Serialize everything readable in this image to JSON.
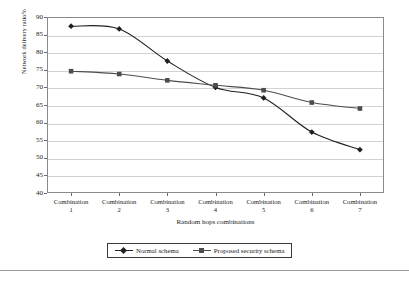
{
  "chart_data": {
    "type": "line",
    "title": "",
    "xlabel": "Random hops combinations",
    "ylabel": "Network delivery ratio%",
    "categories": [
      "Combination 1",
      "Combination 2",
      "Combination 3",
      "Combination 4",
      "Combination 5",
      "Combination 6",
      "Combination 7"
    ],
    "category_lines": [
      [
        "Combination",
        "1"
      ],
      [
        "Combination",
        "2"
      ],
      [
        "Combination",
        "3"
      ],
      [
        "Combination",
        "4"
      ],
      [
        "Combination",
        "5"
      ],
      [
        "Combination",
        "6"
      ],
      [
        "Combination",
        "7"
      ]
    ],
    "series": [
      {
        "name": "Normal schema",
        "marker": "diamond",
        "color": "#231f20",
        "values": [
          87.4,
          86.6,
          77.5,
          70.0,
          67.0,
          57.3,
          52.3
        ]
      },
      {
        "name": "Proposed security schema",
        "marker": "square",
        "color": "#4d4d4d",
        "values": [
          74.6,
          73.8,
          72.0,
          70.6,
          69.2,
          65.7,
          64.0
        ]
      }
    ],
    "ylim": [
      40,
      90
    ],
    "ytick_step": 5,
    "yticks": [
      40,
      45,
      50,
      55,
      60,
      65,
      70,
      75,
      80,
      85,
      90
    ],
    "grid": true,
    "legend_position": "bottom",
    "smoothing": "spline"
  },
  "legend": {
    "entries": [
      {
        "label": "Normal schema",
        "marker": "diamond",
        "color": "#231f20"
      },
      {
        "label": "Proposed security schema",
        "marker": "square",
        "color": "#4d4d4d"
      }
    ]
  },
  "caption": {
    "text": ""
  }
}
